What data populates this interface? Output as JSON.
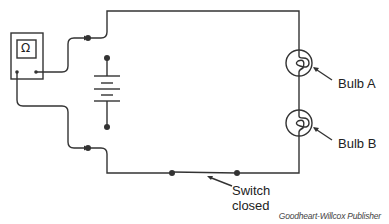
{
  "diagram": {
    "type": "circuit",
    "components": {
      "meter": {
        "symbol": "Ω",
        "name": "ohmmeter"
      },
      "battery": {
        "cells": 2
      },
      "bulbs": [
        {
          "label": "Bulb A"
        },
        {
          "label": "Bulb B"
        }
      ],
      "switch": {
        "label_line1": "Switch",
        "label_line2": "closed"
      }
    },
    "credit": "Goodheart-Willcox Publisher"
  },
  "colors": {
    "wire": "#333333",
    "background": "#ffffff"
  }
}
